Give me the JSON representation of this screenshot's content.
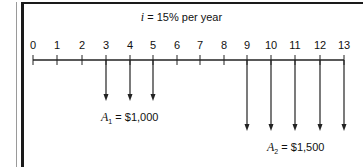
{
  "diagram": {
    "type": "cash-flow-diagram",
    "interest": {
      "symbol": "i",
      "text": "= 15% per year"
    },
    "timeline": {
      "periods": [
        "0",
        "1",
        "2",
        "3",
        "4",
        "5",
        "6",
        "7",
        "8",
        "9",
        "10",
        "11",
        "12",
        "13"
      ],
      "tick_x": [
        33,
        57,
        82,
        106,
        130,
        153,
        177,
        200,
        224,
        247,
        271,
        295,
        320,
        344
      ]
    },
    "series": [
      {
        "name": "A1",
        "symbol": "A",
        "subscript": "1",
        "value_text": "= $1,000",
        "periods": [
          3,
          4,
          5
        ],
        "arrow_end_y": 100
      },
      {
        "name": "A2",
        "symbol": "A",
        "subscript": "2",
        "value_text": "= $1,500",
        "periods": [
          9,
          10,
          11,
          12,
          13
        ],
        "arrow_end_y": 130
      }
    ]
  }
}
